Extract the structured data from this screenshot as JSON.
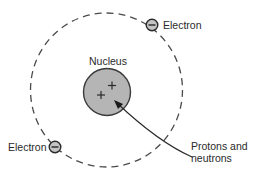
{
  "diagram": {
    "type": "atom-model",
    "labels": {
      "nucleus": "Nucleus",
      "electron_top": "Electron",
      "electron_bottom": "Electron",
      "protons_line1": "Protons and",
      "protons_line2": "neutrons"
    },
    "particles": {
      "proton_symbol": "+",
      "electron_symbol": "−"
    },
    "colors": {
      "nucleus_fill": "#b5b5b5",
      "electron_fill": "#c4c4c4",
      "stroke": "#3a3a3a",
      "orbit": "#4a4a4a"
    }
  }
}
